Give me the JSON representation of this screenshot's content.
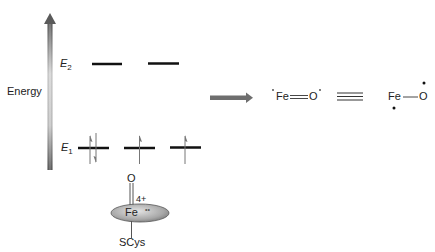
{
  "energy_diagram": {
    "axis_label": "Energy",
    "levels": [
      {
        "name": "E",
        "subscript": "2",
        "orbitals": 2,
        "electrons": [
          "",
          ""
        ]
      },
      {
        "name": "E",
        "subscript": "1",
        "orbitals": 3,
        "electrons": [
          "up-down",
          "up",
          "up"
        ]
      }
    ]
  },
  "heme": {
    "oxo_atom": "O",
    "charge": "4+",
    "metal": "Fe",
    "radical_mark": "••",
    "axial_ligand": "SCys"
  },
  "resonance": {
    "left_structure": {
      "atom1": "Fe",
      "bond": "double",
      "atom2": "O",
      "radicals": [
        "•",
        "•"
      ]
    },
    "equivalence_symbol": "≡",
    "right_structure": {
      "atom1": "Fe",
      "bond": "single",
      "atom2": "O",
      "radicals": [
        "•",
        "•"
      ]
    }
  },
  "colors": {
    "arrow_dark": "#5a5a5a",
    "arrow_light": "#d8d8d8",
    "level_line": "#111111",
    "ellipse_fill": "#b0b0b0"
  }
}
